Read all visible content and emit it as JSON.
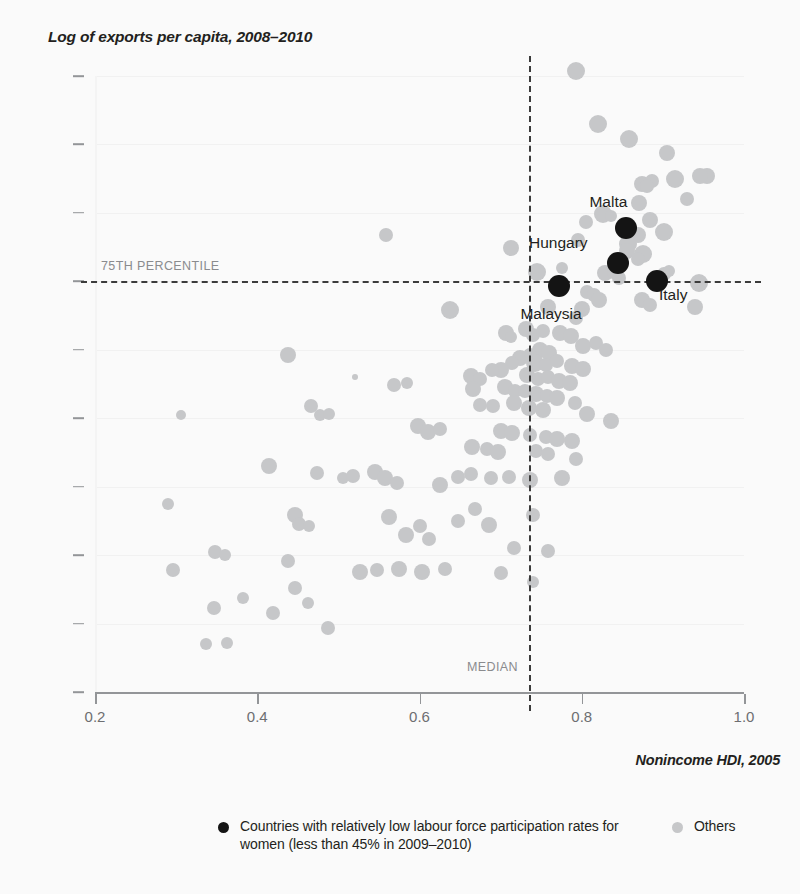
{
  "chart_data": {
    "type": "scatter",
    "title": "Log of exports per capita, 2008–2010",
    "xlabel": "Nonincome HDI, 2005",
    "ylabel": "Log of exports per capita, 2008–2010",
    "xlim": [
      0.2,
      1.0
    ],
    "ylim": [
      3,
      12
    ],
    "xticks": [
      "0.2",
      "0.4",
      "0.6",
      "0.8",
      "1.0"
    ],
    "xtick_values": [
      0.2,
      0.4,
      0.6,
      0.8,
      1.0
    ],
    "yticks": [
      "3",
      "4",
      "5",
      "6",
      "7",
      "8",
      "9",
      "10",
      "11",
      "12"
    ],
    "ytick_values": [
      3,
      4,
      5,
      6,
      7,
      8,
      9,
      10,
      11,
      12
    ],
    "grid": true,
    "legend_position": "bottom",
    "colors": {
      "highlight": "#141414",
      "other": "#c6c7c9",
      "refline": "#3b3b3b",
      "axis": "#939598",
      "text": "#231f20",
      "tick_text": "#6d6e71",
      "annotation": "#8a8b8e",
      "background": "#fafafa",
      "gridline": "#f1f1f1"
    },
    "reference_lines": [
      {
        "orientation": "horizontal",
        "value": 9,
        "label": "75TH PERCENTILE"
      },
      {
        "orientation": "vertical",
        "value": 0.735,
        "label": "MEDIAN"
      }
    ],
    "legend": [
      {
        "marker": "black-dot",
        "label": "Countries with relatively low labour force participation rates for women (less than 45% in 2009–2010)"
      },
      {
        "marker": "grey-dot",
        "label": "Others"
      }
    ],
    "series": [
      {
        "name": "Countries with relatively low labour force participation rates for women (less than 45% in 2009–2010)",
        "marker": "black-dot",
        "points": [
          {
            "label": "Malta",
            "x": 0.855,
            "y": 9.78,
            "r": 11,
            "label_dx": -18,
            "label_dy": -26
          },
          {
            "label": "Hungary",
            "x": 0.845,
            "y": 9.27,
            "r": 11,
            "label_dx": -60,
            "label_dy": -20
          },
          {
            "label": "Italy",
            "x": 0.893,
            "y": 9.0,
            "r": 11,
            "label_dx": 16,
            "label_dy": 14
          },
          {
            "label": "Malaysia",
            "x": 0.772,
            "y": 8.93,
            "r": 11,
            "label_dx": -8,
            "label_dy": 28
          }
        ]
      },
      {
        "name": "Others",
        "marker": "grey-dot",
        "points": [
          {
            "x": 0.793,
            "y": 12.08,
            "r": 9
          },
          {
            "x": 0.82,
            "y": 11.3,
            "r": 9
          },
          {
            "x": 0.858,
            "y": 11.08,
            "r": 9
          },
          {
            "x": 0.905,
            "y": 10.87,
            "r": 8
          },
          {
            "x": 0.955,
            "y": 10.54,
            "r": 8
          },
          {
            "x": 0.946,
            "y": 10.54,
            "r": 8
          },
          {
            "x": 0.915,
            "y": 10.5,
            "r": 9
          },
          {
            "x": 0.874,
            "y": 10.42,
            "r": 8
          },
          {
            "x": 0.887,
            "y": 10.46,
            "r": 7
          },
          {
            "x": 0.88,
            "y": 10.4,
            "r": 7
          },
          {
            "x": 0.871,
            "y": 10.15,
            "r": 8
          },
          {
            "x": 0.93,
            "y": 10.2,
            "r": 7
          },
          {
            "x": 0.826,
            "y": 9.98,
            "r": 9
          },
          {
            "x": 0.836,
            "y": 9.95,
            "r": 6
          },
          {
            "x": 0.805,
            "y": 9.86,
            "r": 7
          },
          {
            "x": 0.884,
            "y": 9.9,
            "r": 8
          },
          {
            "x": 0.902,
            "y": 9.72,
            "r": 9
          },
          {
            "x": 0.869,
            "y": 9.68,
            "r": 8
          },
          {
            "x": 0.857,
            "y": 9.55,
            "r": 9
          },
          {
            "x": 0.795,
            "y": 9.6,
            "r": 7
          },
          {
            "x": 0.856,
            "y": 9.45,
            "r": 8
          },
          {
            "x": 0.876,
            "y": 9.4,
            "r": 9
          },
          {
            "x": 0.869,
            "y": 9.33,
            "r": 7
          },
          {
            "x": 0.559,
            "y": 9.67,
            "r": 7
          },
          {
            "x": 0.713,
            "y": 9.48,
            "r": 8
          },
          {
            "x": 0.745,
            "y": 9.14,
            "r": 9
          },
          {
            "x": 0.776,
            "y": 9.2,
            "r": 6
          },
          {
            "x": 0.829,
            "y": 9.12,
            "r": 8
          },
          {
            "x": 0.838,
            "y": 9.12,
            "r": 6
          },
          {
            "x": 0.846,
            "y": 9.05,
            "r": 7
          },
          {
            "x": 0.901,
            "y": 9.1,
            "r": 7
          },
          {
            "x": 0.908,
            "y": 9.15,
            "r": 6
          },
          {
            "x": 0.945,
            "y": 8.98,
            "r": 9
          },
          {
            "x": 0.939,
            "y": 8.63,
            "r": 8
          },
          {
            "x": 0.806,
            "y": 8.85,
            "r": 7
          },
          {
            "x": 0.815,
            "y": 8.8,
            "r": 7
          },
          {
            "x": 0.821,
            "y": 8.72,
            "r": 8
          },
          {
            "x": 0.874,
            "y": 8.73,
            "r": 8
          },
          {
            "x": 0.884,
            "y": 8.66,
            "r": 7
          },
          {
            "x": 0.638,
            "y": 8.58,
            "r": 9
          },
          {
            "x": 0.758,
            "y": 8.63,
            "r": 8
          },
          {
            "x": 0.8,
            "y": 8.6,
            "r": 8
          },
          {
            "x": 0.793,
            "y": 8.46,
            "r": 7
          },
          {
            "x": 0.707,
            "y": 8.25,
            "r": 8
          },
          {
            "x": 0.713,
            "y": 8.18,
            "r": 6
          },
          {
            "x": 0.731,
            "y": 8.3,
            "r": 8
          },
          {
            "x": 0.74,
            "y": 8.22,
            "r": 7
          },
          {
            "x": 0.752,
            "y": 8.28,
            "r": 7
          },
          {
            "x": 0.773,
            "y": 8.25,
            "r": 8
          },
          {
            "x": 0.787,
            "y": 8.2,
            "r": 8
          },
          {
            "x": 0.802,
            "y": 8.06,
            "r": 8
          },
          {
            "x": 0.818,
            "y": 8.1,
            "r": 7
          },
          {
            "x": 0.83,
            "y": 8.0,
            "r": 7
          },
          {
            "x": 0.748,
            "y": 8.0,
            "r": 8
          },
          {
            "x": 0.76,
            "y": 7.96,
            "r": 8
          },
          {
            "x": 0.736,
            "y": 7.92,
            "r": 7
          },
          {
            "x": 0.724,
            "y": 7.88,
            "r": 8
          },
          {
            "x": 0.714,
            "y": 7.8,
            "r": 7
          },
          {
            "x": 0.742,
            "y": 7.8,
            "r": 9
          },
          {
            "x": 0.756,
            "y": 7.78,
            "r": 7
          },
          {
            "x": 0.769,
            "y": 7.83,
            "r": 7
          },
          {
            "x": 0.788,
            "y": 7.76,
            "r": 8
          },
          {
            "x": 0.802,
            "y": 7.72,
            "r": 8
          },
          {
            "x": 0.7,
            "y": 7.7,
            "r": 8
          },
          {
            "x": 0.689,
            "y": 7.7,
            "r": 7
          },
          {
            "x": 0.663,
            "y": 7.62,
            "r": 8
          },
          {
            "x": 0.675,
            "y": 7.58,
            "r": 7
          },
          {
            "x": 0.733,
            "y": 7.63,
            "r": 8
          },
          {
            "x": 0.746,
            "y": 7.58,
            "r": 7
          },
          {
            "x": 0.759,
            "y": 7.6,
            "r": 7
          },
          {
            "x": 0.772,
            "y": 7.55,
            "r": 8
          },
          {
            "x": 0.785,
            "y": 7.52,
            "r": 8
          },
          {
            "x": 0.438,
            "y": 7.92,
            "r": 8
          },
          {
            "x": 0.569,
            "y": 7.48,
            "r": 7
          },
          {
            "x": 0.585,
            "y": 7.52,
            "r": 6
          },
          {
            "x": 0.521,
            "y": 7.6,
            "r": 3
          },
          {
            "x": 0.666,
            "y": 7.42,
            "r": 8
          },
          {
            "x": 0.706,
            "y": 7.45,
            "r": 8
          },
          {
            "x": 0.718,
            "y": 7.4,
            "r": 7
          },
          {
            "x": 0.73,
            "y": 7.4,
            "r": 7
          },
          {
            "x": 0.744,
            "y": 7.36,
            "r": 8
          },
          {
            "x": 0.757,
            "y": 7.33,
            "r": 7
          },
          {
            "x": 0.77,
            "y": 7.3,
            "r": 8
          },
          {
            "x": 0.674,
            "y": 7.2,
            "r": 7
          },
          {
            "x": 0.69,
            "y": 7.18,
            "r": 7
          },
          {
            "x": 0.717,
            "y": 7.22,
            "r": 8
          },
          {
            "x": 0.735,
            "y": 7.15,
            "r": 8
          },
          {
            "x": 0.752,
            "y": 7.12,
            "r": 8
          },
          {
            "x": 0.792,
            "y": 7.22,
            "r": 7
          },
          {
            "x": 0.806,
            "y": 7.06,
            "r": 8
          },
          {
            "x": 0.836,
            "y": 6.96,
            "r": 8
          },
          {
            "x": 0.466,
            "y": 7.18,
            "r": 7
          },
          {
            "x": 0.477,
            "y": 7.04,
            "r": 6
          },
          {
            "x": 0.489,
            "y": 7.06,
            "r": 6
          },
          {
            "x": 0.306,
            "y": 7.04,
            "r": 5
          },
          {
            "x": 0.598,
            "y": 6.88,
            "r": 8
          },
          {
            "x": 0.611,
            "y": 6.8,
            "r": 8
          },
          {
            "x": 0.625,
            "y": 6.84,
            "r": 7
          },
          {
            "x": 0.7,
            "y": 6.82,
            "r": 8
          },
          {
            "x": 0.714,
            "y": 6.78,
            "r": 8
          },
          {
            "x": 0.736,
            "y": 6.75,
            "r": 7
          },
          {
            "x": 0.756,
            "y": 6.72,
            "r": 7
          },
          {
            "x": 0.77,
            "y": 6.7,
            "r": 8
          },
          {
            "x": 0.788,
            "y": 6.66,
            "r": 8
          },
          {
            "x": 0.665,
            "y": 6.58,
            "r": 8
          },
          {
            "x": 0.683,
            "y": 6.55,
            "r": 7
          },
          {
            "x": 0.697,
            "y": 6.5,
            "r": 8
          },
          {
            "x": 0.744,
            "y": 6.52,
            "r": 7
          },
          {
            "x": 0.759,
            "y": 6.48,
            "r": 7
          },
          {
            "x": 0.415,
            "y": 6.3,
            "r": 8
          },
          {
            "x": 0.474,
            "y": 6.2,
            "r": 7
          },
          {
            "x": 0.506,
            "y": 6.12,
            "r": 6
          },
          {
            "x": 0.518,
            "y": 6.15,
            "r": 7
          },
          {
            "x": 0.545,
            "y": 6.22,
            "r": 8
          },
          {
            "x": 0.557,
            "y": 6.12,
            "r": 8
          },
          {
            "x": 0.572,
            "y": 6.06,
            "r": 7
          },
          {
            "x": 0.625,
            "y": 6.02,
            "r": 8
          },
          {
            "x": 0.647,
            "y": 6.14,
            "r": 7
          },
          {
            "x": 0.663,
            "y": 6.18,
            "r": 7
          },
          {
            "x": 0.688,
            "y": 6.12,
            "r": 7
          },
          {
            "x": 0.71,
            "y": 6.14,
            "r": 7
          },
          {
            "x": 0.736,
            "y": 6.1,
            "r": 8
          },
          {
            "x": 0.776,
            "y": 6.12,
            "r": 8
          },
          {
            "x": 0.793,
            "y": 6.4,
            "r": 7
          },
          {
            "x": 0.29,
            "y": 5.75,
            "r": 6
          },
          {
            "x": 0.348,
            "y": 5.04,
            "r": 7
          },
          {
            "x": 0.36,
            "y": 5.0,
            "r": 6
          },
          {
            "x": 0.446,
            "y": 5.58,
            "r": 8
          },
          {
            "x": 0.452,
            "y": 5.46,
            "r": 7
          },
          {
            "x": 0.464,
            "y": 5.42,
            "r": 6
          },
          {
            "x": 0.438,
            "y": 4.92,
            "r": 7
          },
          {
            "x": 0.296,
            "y": 4.78,
            "r": 7
          },
          {
            "x": 0.347,
            "y": 4.22,
            "r": 7
          },
          {
            "x": 0.383,
            "y": 4.38,
            "r": 6
          },
          {
            "x": 0.42,
            "y": 4.16,
            "r": 7
          },
          {
            "x": 0.446,
            "y": 4.52,
            "r": 7
          },
          {
            "x": 0.463,
            "y": 4.3,
            "r": 6
          },
          {
            "x": 0.487,
            "y": 3.94,
            "r": 7
          },
          {
            "x": 0.337,
            "y": 3.7,
            "r": 6
          },
          {
            "x": 0.363,
            "y": 3.72,
            "r": 6
          },
          {
            "x": 0.527,
            "y": 4.76,
            "r": 8
          },
          {
            "x": 0.548,
            "y": 4.78,
            "r": 7
          },
          {
            "x": 0.575,
            "y": 4.8,
            "r": 8
          },
          {
            "x": 0.603,
            "y": 4.76,
            "r": 8
          },
          {
            "x": 0.631,
            "y": 4.8,
            "r": 7
          },
          {
            "x": 0.563,
            "y": 5.56,
            "r": 8
          },
          {
            "x": 0.583,
            "y": 5.3,
            "r": 8
          },
          {
            "x": 0.6,
            "y": 5.42,
            "r": 7
          },
          {
            "x": 0.612,
            "y": 5.24,
            "r": 7
          },
          {
            "x": 0.7,
            "y": 4.74,
            "r": 7
          },
          {
            "x": 0.716,
            "y": 5.1,
            "r": 7
          },
          {
            "x": 0.686,
            "y": 5.44,
            "r": 8
          },
          {
            "x": 0.668,
            "y": 5.68,
            "r": 7
          },
          {
            "x": 0.648,
            "y": 5.5,
            "r": 7
          },
          {
            "x": 0.74,
            "y": 5.58,
            "r": 7
          },
          {
            "x": 0.758,
            "y": 5.06,
            "r": 7
          },
          {
            "x": 0.74,
            "y": 4.6,
            "r": 6
          }
        ]
      }
    ]
  }
}
